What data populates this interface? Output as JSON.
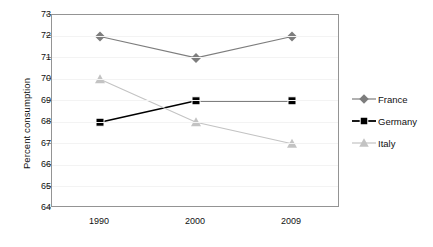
{
  "chart_data": {
    "type": "line",
    "title": "",
    "xlabel": "",
    "ylabel": "Percent consumption",
    "categories": [
      "1990",
      "2000",
      "2009"
    ],
    "ylim": [
      64,
      73
    ],
    "yticks": [
      "64",
      "65",
      "66",
      "67",
      "68",
      "69",
      "70",
      "71",
      "72",
      "73"
    ],
    "ystep": 1,
    "grid": "horizontal-only",
    "legend_position": "right",
    "series": [
      {
        "name": "France",
        "marker": "diamond",
        "color": "#7d7d7d",
        "values": [
          72,
          71,
          72
        ]
      },
      {
        "name": "Germany",
        "marker": "square",
        "color": "#000000",
        "values": [
          68,
          69,
          69
        ]
      },
      {
        "name": "Italy",
        "marker": "triangle",
        "color": "#c3c3c3",
        "values": [
          70,
          68,
          67
        ]
      }
    ]
  },
  "axes": {
    "y_title": "Percent consumption"
  },
  "colors": {
    "frame": "#949494",
    "grid": "#f3f3f3",
    "text": "#111111",
    "background": "#ffffff"
  }
}
